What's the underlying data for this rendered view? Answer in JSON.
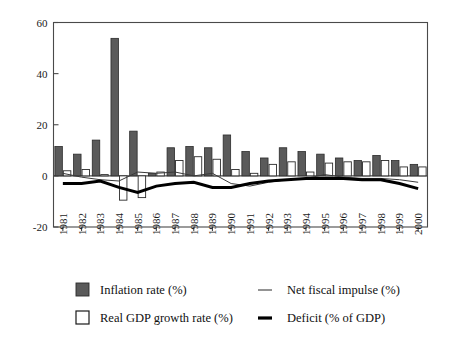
{
  "chart_data": {
    "type": "bar",
    "title": "",
    "subtitle": "",
    "xlabel": "",
    "ylabel": "",
    "xlim": [
      1981,
      2000
    ],
    "ylim": [
      -20,
      60
    ],
    "yticks": [
      -20,
      0,
      20,
      40,
      60
    ],
    "ytick_labels": [
      "-20",
      "0",
      "20",
      "40",
      "60"
    ],
    "grid": false,
    "legend_position": "below-plot",
    "categories": [
      "1981",
      "1982",
      "1983",
      "1984",
      "1985",
      "1986",
      "1987",
      "1988",
      "1989",
      "1990",
      "1991",
      "1992",
      "1993",
      "1994",
      "1995",
      "1996",
      "1997",
      "1998",
      "1999",
      "2000"
    ],
    "series": [
      {
        "name": "Inflation rate (%)",
        "kind": "bar",
        "style": "filled-dark",
        "color": "#5a5a5a",
        "values": [
          11.5,
          8.5,
          14.0,
          53.8,
          17.5,
          1.0,
          11.0,
          11.5,
          11.0,
          16.0,
          9.5,
          7.0,
          11.0,
          9.5,
          8.5,
          7.0,
          6.0,
          8.0,
          6.0,
          4.5
        ]
      },
      {
        "name": "Real GDP growth rate (%)",
        "kind": "bar",
        "style": "open-white",
        "color": "#ffffff",
        "values": [
          2.0,
          2.5,
          0.5,
          -9.5,
          -8.5,
          1.5,
          6.0,
          7.5,
          6.5,
          2.5,
          1.0,
          4.5,
          5.5,
          1.5,
          5.0,
          5.5,
          5.5,
          6.0,
          3.5,
          3.5
        ]
      },
      {
        "name": "Net fiscal impulse (%)",
        "kind": "line",
        "style": "thin",
        "color": "#3a3a3a",
        "values": [
          1.0,
          -0.5,
          -1.5,
          -2.0,
          1.5,
          1.0,
          1.5,
          0.0,
          1.0,
          -3.0,
          -4.0,
          -2.5,
          -1.5,
          -1.0,
          0.5,
          -0.5,
          -1.0,
          -1.0,
          -1.5,
          -2.5
        ]
      },
      {
        "name": "Deficit (% of GDP)",
        "kind": "line",
        "style": "thick",
        "color": "#000000",
        "values": [
          -3.0,
          -3.0,
          -2.0,
          -4.5,
          -6.5,
          -4.0,
          -3.0,
          -2.5,
          -4.5,
          -4.5,
          -3.0,
          -2.0,
          -1.5,
          -1.0,
          -1.0,
          -1.0,
          -1.5,
          -1.5,
          -3.0,
          -5.0
        ]
      }
    ]
  },
  "legend": {
    "entries": [
      {
        "label": "Inflation rate (%)",
        "marker": "square-filled-icon"
      },
      {
        "label": "Real GDP growth rate (%)",
        "marker": "square-open-icon"
      },
      {
        "label": "Net fiscal impulse (%)",
        "marker": "line-thin-icon"
      },
      {
        "label": "Deficit (% of GDP)",
        "marker": "line-thick-icon"
      }
    ]
  },
  "colors": {
    "inflation": "#5a5a5a",
    "gdp": "#ffffff",
    "impulse": "#3a3a3a",
    "deficit": "#000000",
    "axis": "#4a4a4a",
    "background": "#ffffff"
  }
}
